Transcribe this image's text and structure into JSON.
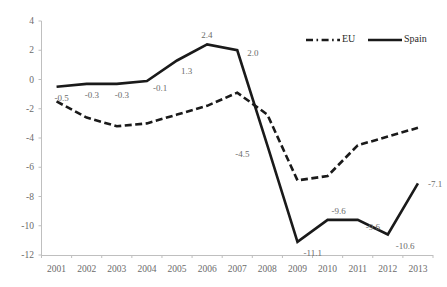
{
  "chart_data": {
    "type": "line",
    "title": "",
    "xlabel": "",
    "ylabel": "",
    "categories": [
      "2001",
      "2002",
      "2003",
      "2004",
      "2005",
      "2006",
      "2007",
      "2008",
      "2009",
      "2010",
      "2011",
      "2012",
      "2013"
    ],
    "ylim": [
      -12,
      4
    ],
    "yticks": [
      4,
      2,
      0,
      -2,
      -4,
      -6,
      -8,
      -10,
      -12
    ],
    "ytick_labels": [
      "4",
      "2",
      "0",
      "-2",
      "-4",
      "-6",
      "-8",
      "-10",
      "-12"
    ],
    "grid": false,
    "legend_position": "top-right",
    "series": [
      {
        "name": "EU",
        "style": "dashed",
        "color": "#1a1a1a",
        "labels_shown": false,
        "values": [
          -1.5,
          -2.6,
          -3.2,
          -3.0,
          -2.4,
          -1.8,
          -0.9,
          -2.4,
          -6.9,
          -6.6,
          -4.5,
          -3.9,
          -3.3
        ]
      },
      {
        "name": "Spain",
        "style": "solid",
        "color": "#1a1a1a",
        "labels_shown": true,
        "values": [
          -0.5,
          -0.3,
          -0.3,
          -0.1,
          1.3,
          2.4,
          2.0,
          -4.5,
          -11.1,
          -9.6,
          -9.6,
          -10.6,
          -7.1
        ]
      }
    ],
    "data_labels": [
      {
        "text": "-0.5",
        "series": "Spain",
        "category": "2001",
        "value": -0.5
      },
      {
        "text": "-0.3",
        "series": "Spain",
        "category": "2002",
        "value": -0.3
      },
      {
        "text": "-0.3",
        "series": "Spain",
        "category": "2003",
        "value": -0.3
      },
      {
        "text": "-0.1",
        "series": "Spain",
        "category": "2004",
        "value": -0.1
      },
      {
        "text": "1.3",
        "series": "Spain",
        "category": "2005",
        "value": 1.3
      },
      {
        "text": "2.4",
        "series": "Spain",
        "category": "2006",
        "value": 2.4
      },
      {
        "text": "2.0",
        "series": "Spain",
        "category": "2007",
        "value": 2.0
      },
      {
        "text": "-4.5",
        "series": "Spain",
        "category": "2008",
        "value": -4.5
      },
      {
        "text": "-11.1",
        "series": "Spain",
        "category": "2009",
        "value": -11.1
      },
      {
        "text": "-9.6",
        "series": "Spain",
        "category": "2010",
        "value": -9.6
      },
      {
        "text": "-9.6",
        "series": "Spain",
        "category": "2011",
        "value": -9.6
      },
      {
        "text": "-10.6",
        "series": "Spain",
        "category": "2012",
        "value": -10.6
      },
      {
        "text": "-7.1",
        "series": "Spain",
        "category": "2013",
        "value": -7.1
      }
    ]
  },
  "legend": {
    "entries": [
      {
        "label": "EU",
        "style": "dashed"
      },
      {
        "label": "Spain",
        "style": "solid"
      }
    ]
  },
  "colors": {
    "line": "#1a1a1a",
    "axis": "#bfbfbf",
    "tick_text": "#6b6b6b",
    "label_text": "#6b6b6b",
    "legend_text": "#2b2b2b",
    "background": "#ffffff"
  }
}
